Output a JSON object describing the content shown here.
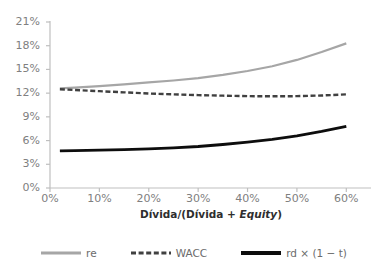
{
  "chart_data": {
    "type": "line",
    "title": "",
    "subtitle": "",
    "xlabel": "Dívida/(Dívida + Equity)",
    "ylabel": "",
    "xlim": [
      0,
      65
    ],
    "ylim": [
      0,
      21
    ],
    "grid": false,
    "legend_position": "bottom",
    "x_tick_labels": [
      "0%",
      "10%",
      "20%",
      "30%",
      "40%",
      "50%",
      "60%"
    ],
    "x_tick_values": [
      0,
      10,
      20,
      30,
      40,
      50,
      60
    ],
    "y_tick_labels": [
      "0%",
      "3%",
      "6%",
      "9%",
      "12%",
      "15%",
      "18%",
      "21%"
    ],
    "y_tick_values": [
      0,
      3,
      6,
      9,
      12,
      15,
      18,
      21
    ],
    "x": [
      2,
      5,
      10,
      15,
      20,
      25,
      30,
      35,
      40,
      45,
      50,
      55,
      60
    ],
    "series": [
      {
        "name": "re",
        "style": "solid",
        "color": "#a6a6a6",
        "width": 2.2,
        "values": [
          12.6,
          12.7,
          12.9,
          13.1,
          13.35,
          13.6,
          13.9,
          14.3,
          14.8,
          15.4,
          16.2,
          17.2,
          18.3
        ]
      },
      {
        "name": "WACC",
        "style": "dashed",
        "color": "#404040",
        "width": 2.4,
        "values": [
          12.5,
          12.4,
          12.25,
          12.1,
          11.95,
          11.85,
          11.75,
          11.68,
          11.62,
          11.6,
          11.62,
          11.7,
          11.85
        ]
      },
      {
        "name": "rd × (1 − t)",
        "style": "solid",
        "color": "#0d0d0d",
        "width": 2.8,
        "values": [
          4.7,
          4.72,
          4.78,
          4.85,
          4.95,
          5.08,
          5.25,
          5.5,
          5.8,
          6.15,
          6.6,
          7.15,
          7.8
        ]
      }
    ]
  },
  "axes": {
    "y_ticks": [
      {
        "label": "21%",
        "value": 21
      },
      {
        "label": "18%",
        "value": 18
      },
      {
        "label": "15%",
        "value": 15
      },
      {
        "label": "12%",
        "value": 12
      },
      {
        "label": "9%",
        "value": 9
      },
      {
        "label": "6%",
        "value": 6
      },
      {
        "label": "3%",
        "value": 3
      },
      {
        "label": "0%",
        "value": 0
      }
    ],
    "x_ticks": [
      {
        "label": "0%",
        "value": 0
      },
      {
        "label": "10%",
        "value": 10
      },
      {
        "label": "20%",
        "value": 20
      },
      {
        "label": "30%",
        "value": 30
      },
      {
        "label": "40%",
        "value": 40
      },
      {
        "label": "50%",
        "value": 50
      },
      {
        "label": "60%",
        "value": 60
      }
    ],
    "axis_color": "#bfbfbf",
    "tick_text_color": "#808080"
  },
  "x_axis_title": {
    "part1": "Dívida/(Dívida + ",
    "part2": "Equity",
    "part3": ")"
  },
  "legend": {
    "items": [
      {
        "label": "re",
        "style": "solid",
        "color": "#a6a6a6",
        "width": 3
      },
      {
        "label": "WACC",
        "style": "dashed",
        "color": "#404040",
        "width": 3.2
      },
      {
        "label": "rd × (1 − t)",
        "style": "solid",
        "color": "#0d0d0d",
        "width": 4
      }
    ]
  }
}
